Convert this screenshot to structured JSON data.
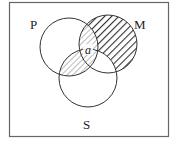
{
  "diagram": {
    "type": "venn",
    "sets": [
      {
        "name": "P",
        "label": "P",
        "cx": 69,
        "cy": 47,
        "r": 29
      },
      {
        "name": "M",
        "label": "M",
        "cx": 108,
        "cy": 44,
        "r": 29
      },
      {
        "name": "S",
        "label": "S",
        "cx": 88,
        "cy": 78,
        "r": 29
      }
    ],
    "labels": {
      "P": "P",
      "M": "M",
      "S": "S",
      "point": "a"
    },
    "shaded_regions": [
      {
        "region": "M only",
        "style": "dense-hatch"
      },
      {
        "region": "P∩M only",
        "style": "light-hatch"
      },
      {
        "region": "P∩M∩S",
        "style": "light-hatch"
      },
      {
        "region": "P∩S only",
        "style": "light-hatch"
      }
    ],
    "unshaded_regions": [
      "P only",
      "S only",
      "M∩S only"
    ],
    "colors": {
      "stroke": "#333333",
      "frame": "#666666",
      "hatch": "#444444",
      "background": "#ffffff"
    }
  }
}
